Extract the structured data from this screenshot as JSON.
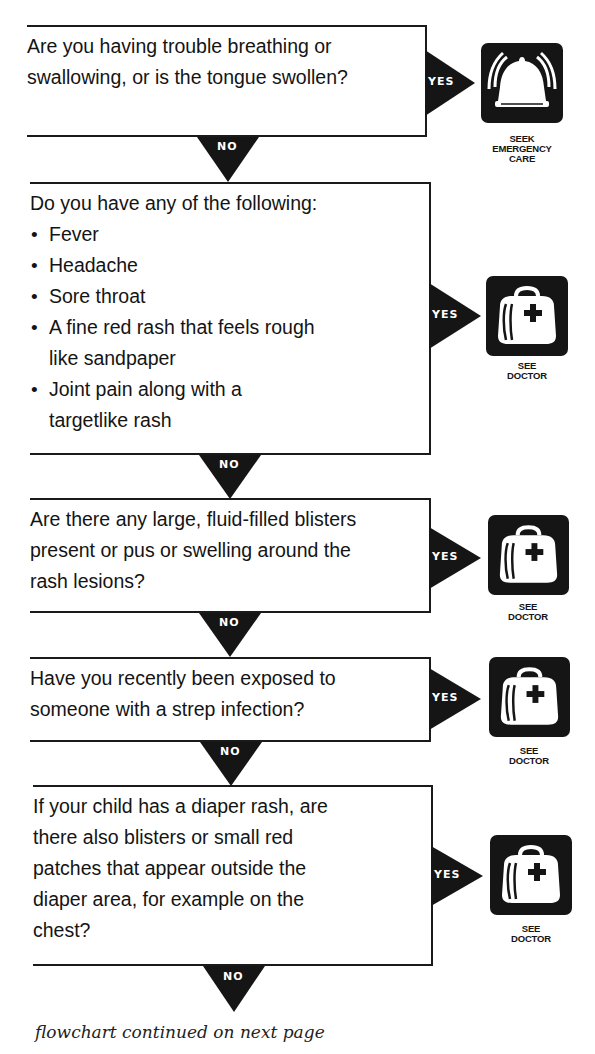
{
  "flowchart": {
    "steps": [
      {
        "question": "Are you having trouble breathing or swallowing, or is the tongue swollen?",
        "yes_label": "YES",
        "no_label": "NO",
        "outcome": {
          "icon": "emergency-bell-icon",
          "caption_lines": [
            "SEEK",
            "EMERGENCY",
            "CARE"
          ]
        }
      },
      {
        "question": "Do you have any of the following:",
        "bullets": [
          "Fever",
          "Headache",
          "Sore throat",
          "A fine red rash that feels rough like sandpaper",
          "Joint pain along with a targetlike rash"
        ],
        "yes_label": "YES",
        "no_label": "NO",
        "outcome": {
          "icon": "doctor-bag-icon",
          "caption_lines": [
            "SEE",
            "DOCTOR"
          ]
        }
      },
      {
        "question": "Are there any large, fluid-filled blisters present or pus or swelling around the rash lesions?",
        "yes_label": "YES",
        "no_label": "NO",
        "outcome": {
          "icon": "doctor-bag-icon",
          "caption_lines": [
            "SEE",
            "DOCTOR"
          ]
        }
      },
      {
        "question": "Have you recently been exposed to someone with a strep infection?",
        "yes_label": "YES",
        "no_label": "NO",
        "outcome": {
          "icon": "doctor-bag-icon",
          "caption_lines": [
            "SEE",
            "DOCTOR"
          ]
        }
      },
      {
        "question": "If your child has a diaper rash, are there also blisters or small red patches that appear outside the diaper area, for example on the chest?",
        "yes_label": "YES",
        "no_label": "NO",
        "outcome": {
          "icon": "doctor-bag-icon",
          "caption_lines": [
            "SEE",
            "DOCTOR"
          ]
        }
      }
    ],
    "footer": "flowchart continued on next page"
  },
  "colors": {
    "ink": "#151515",
    "paper": "#ffffff"
  }
}
